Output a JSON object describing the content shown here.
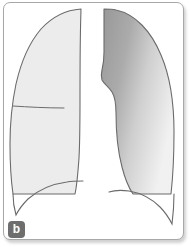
{
  "figure": {
    "panel_label": "b",
    "caption": "",
    "frame": {
      "border_color": "#a8a8a8",
      "background_color": "#ffffff",
      "corner_radius": 7
    },
    "badge": {
      "background_color": "#6e6e6e",
      "text_color": "#ffffff"
    },
    "outline_color": "#6b6b6b",
    "structures": [
      {
        "name": "right-lung-field",
        "side": "viewer-left",
        "fill_type": "solid",
        "fill_color": "#ececec",
        "description": "light gray lung field"
      },
      {
        "name": "left-lung-field",
        "side": "viewer-right",
        "fill_type": "gradient",
        "fill_color_start": "#9e9e9e",
        "fill_color_end": "#f0f0f0",
        "description": "lung field with gray-to-light gradient opacity"
      },
      {
        "name": "horizontal-fissure-line",
        "fill_type": "line",
        "fill_color": "#6b6b6b",
        "description": "horizontal fissure marking in left-side lung field"
      },
      {
        "name": "diaphragm-contour-left",
        "fill_type": "line",
        "fill_color": "#6b6b6b",
        "description": "costophrenic / diaphragm curve below viewer-left lung"
      },
      {
        "name": "diaphragm-contour-right",
        "fill_type": "line",
        "fill_color": "#6b6b6b",
        "description": "costophrenic / diaphragm curve below viewer-right lung"
      }
    ]
  }
}
